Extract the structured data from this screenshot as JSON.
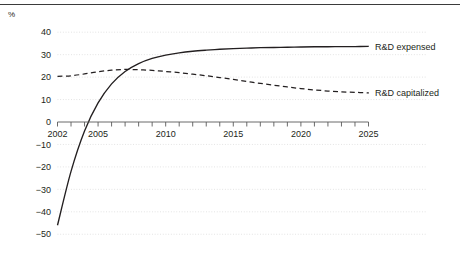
{
  "figure": {
    "unit_label": "%",
    "background_color": "#ffffff",
    "rule_color": "#3b3b3b",
    "grid_color": "#d9d9d9",
    "axis_color": "#5a5a5a",
    "series_color": "#231f20"
  },
  "chart_data": {
    "type": "line",
    "title": "",
    "subtitle": "",
    "xlabel": "",
    "ylabel": "%",
    "xlim": [
      2002,
      2025
    ],
    "ylim": [
      -50,
      40
    ],
    "yticks": [
      40,
      30,
      20,
      10,
      0,
      -10,
      -20,
      -30,
      -40,
      -50
    ],
    "ytick_labels": [
      "40",
      "30",
      "20",
      "10",
      "0",
      "−10",
      "−20",
      "−30",
      "−40",
      "−50"
    ],
    "xticks": [
      2002,
      2003,
      2004,
      2005,
      2006,
      2007,
      2008,
      2009,
      2010,
      2011,
      2012,
      2013,
      2014,
      2015,
      2016,
      2017,
      2018,
      2019,
      2020,
      2021,
      2022,
      2023,
      2024,
      2025
    ],
    "xtick_labels_shown": [
      "2002",
      "2005",
      "2010",
      "2015",
      "2020",
      "2025"
    ],
    "grid": "horizontal-dotted",
    "legend_position": "right-of-plot",
    "series": [
      {
        "name": "R&D expensed",
        "style": "solid",
        "x": [
          2002,
          2003,
          2004,
          2005,
          2006,
          2007,
          2008,
          2009,
          2010,
          2011,
          2012,
          2013,
          2014,
          2015,
          2016,
          2017,
          2018,
          2019,
          2020,
          2021,
          2022,
          2023,
          2024,
          2025
        ],
        "values": [
          -46.0,
          -22.0,
          -4.0,
          8.5,
          17.0,
          22.5,
          26.0,
          28.3,
          29.8,
          30.8,
          31.5,
          32.0,
          32.4,
          32.7,
          32.9,
          33.1,
          33.2,
          33.3,
          33.4,
          33.5,
          33.5,
          33.6,
          33.6,
          33.7
        ]
      },
      {
        "name": "R&D capitalized",
        "style": "dashed",
        "x": [
          2002,
          2003,
          2004,
          2005,
          2006,
          2007,
          2008,
          2009,
          2010,
          2011,
          2012,
          2013,
          2014,
          2015,
          2016,
          2017,
          2018,
          2019,
          2020,
          2021,
          2022,
          2023,
          2024,
          2025
        ],
        "values": [
          20.3,
          20.6,
          21.4,
          22.4,
          23.1,
          23.4,
          23.3,
          23.0,
          22.5,
          22.0,
          21.3,
          20.6,
          19.8,
          19.0,
          18.1,
          17.2,
          16.4,
          15.6,
          14.9,
          14.3,
          13.8,
          13.4,
          13.2,
          13.0
        ]
      }
    ],
    "legend": [
      {
        "label": "R&D expensed",
        "style": "solid"
      },
      {
        "label": "R&D capitalized",
        "style": "dashed"
      }
    ]
  }
}
